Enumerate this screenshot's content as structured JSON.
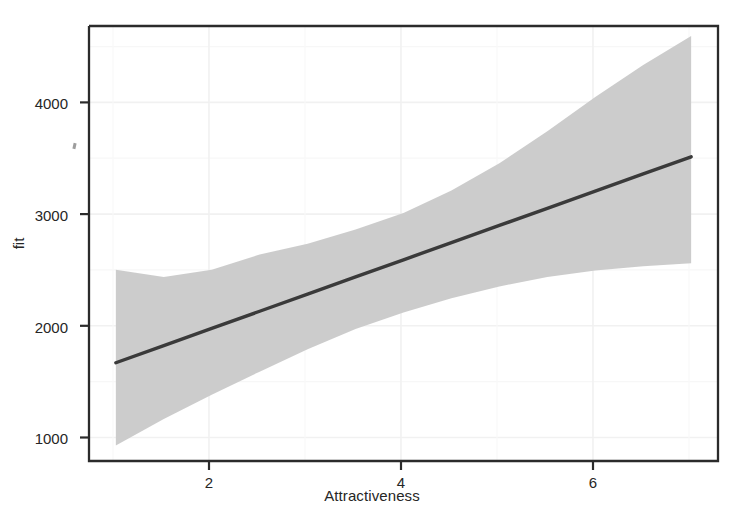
{
  "chart_data": {
    "type": "line",
    "title": "",
    "subtitle": "",
    "xlabel": "Attractiveness",
    "ylabel": "fit",
    "xlim": [
      0.72,
      7.28
    ],
    "ylim": [
      945,
      4620
    ],
    "xticks": [
      2,
      4,
      6
    ],
    "xtick_labels": [
      "2",
      "4",
      "6"
    ],
    "yticks": [
      1000,
      2000,
      3000,
      4000
    ],
    "ytick_labels": [
      "1000",
      "2000",
      "3000",
      "4000"
    ],
    "grid": true,
    "legend": "none",
    "series": [
      {
        "name": "fit",
        "type": "line",
        "x": [
          1,
          1.5,
          2,
          2.5,
          3,
          3.5,
          4,
          4.5,
          5,
          5.5,
          6,
          6.5,
          7
        ],
        "values": [
          1775,
          1920,
          2065,
          2210,
          2355,
          2500,
          2645,
          2790,
          2935,
          3080,
          3225,
          3370,
          3515
        ]
      },
      {
        "name": "confidence band upper",
        "type": "band-upper",
        "x": [
          1,
          1.5,
          2,
          2.5,
          3,
          3.5,
          4,
          4.5,
          5,
          5.5,
          6,
          6.5,
          7
        ],
        "values": [
          2560,
          2500,
          2560,
          2690,
          2780,
          2900,
          3040,
          3230,
          3460,
          3730,
          4020,
          4290,
          4535
        ]
      },
      {
        "name": "confidence band lower",
        "type": "band-lower",
        "x": [
          1,
          1.5,
          2,
          2.5,
          3,
          3.5,
          4,
          4.5,
          5,
          5.5,
          6,
          6.5,
          7
        ],
        "values": [
          1075,
          1300,
          1505,
          1700,
          1890,
          2060,
          2200,
          2320,
          2420,
          2500,
          2555,
          2590,
          2615
        ]
      }
    ],
    "colors": {
      "line": "#3a3a3a",
      "band": "#c9c9c9",
      "grid": "#f2f2f2",
      "axis": "#2b2b2b",
      "background": "#ffffff"
    }
  },
  "axes": {
    "x_title": "Attractiveness",
    "y_title": "fit"
  },
  "ticks": {
    "x": [
      {
        "label": "2",
        "value": 2
      },
      {
        "label": "4",
        "value": 4
      },
      {
        "label": "6",
        "value": 6
      }
    ],
    "y": [
      {
        "label": "1000",
        "value": 1000
      },
      {
        "label": "2000",
        "value": 2000
      },
      {
        "label": "3000",
        "value": 3000
      },
      {
        "label": "4000",
        "value": 4000
      }
    ]
  }
}
